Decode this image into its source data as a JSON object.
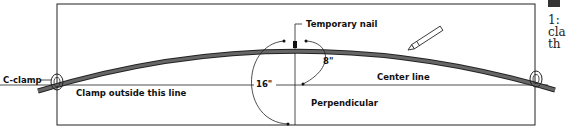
{
  "diagram": {
    "labels": {
      "c_clamp": "C-clamp",
      "clamp_outside": "Clamp outside this line",
      "temporary_nail": "Temporary nail",
      "eight_inch": "8\"",
      "sixteen_inch": "16\"",
      "center_line": "Center line",
      "perpendicular": "Perpendicular"
    },
    "colors": {
      "line": "#222222",
      "strip_fill": "#555555",
      "background": "#ffffff"
    }
  },
  "side_text": {
    "lines": [
      "1:",
      "cla",
      "th"
    ]
  }
}
